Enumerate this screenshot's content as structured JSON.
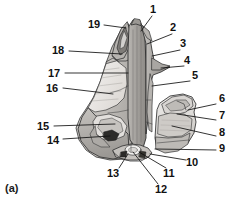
{
  "figure": {
    "caption": "(a)",
    "colors": {
      "ink": "#1a1a1a",
      "outline": "#2b2b2b",
      "fill_light": "#e7e6e4",
      "fill_mid": "#c9c7c4",
      "fill_dark": "#a8a5a2",
      "fill_deep": "#8a8784",
      "background": "#ffffff"
    }
  },
  "labels": [
    {
      "id": "1",
      "text": "1",
      "x": 150,
      "y": 4,
      "leader": [
        [
          152,
          16
        ],
        [
          141,
          31
        ]
      ]
    },
    {
      "id": "2",
      "text": "2",
      "x": 170,
      "y": 22,
      "leader": [
        [
          172,
          34
        ],
        [
          147,
          44
        ]
      ]
    },
    {
      "id": "3",
      "text": "3",
      "x": 180,
      "y": 38,
      "leader": [
        [
          180,
          50
        ],
        [
          152,
          56
        ]
      ]
    },
    {
      "id": "4",
      "text": "4",
      "x": 184,
      "y": 55,
      "leader": [
        [
          184,
          66
        ],
        [
          161,
          68
        ]
      ]
    },
    {
      "id": "5",
      "text": "5",
      "x": 192,
      "y": 70,
      "leader": [
        [
          190,
          81
        ],
        [
          152,
          86
        ]
      ]
    },
    {
      "id": "6",
      "text": "6",
      "x": 219,
      "y": 93,
      "leader": [
        [
          216,
          104
        ],
        [
          188,
          110
        ]
      ]
    },
    {
      "id": "7",
      "text": "7",
      "x": 219,
      "y": 110,
      "leader": [
        [
          216,
          120
        ],
        [
          177,
          114
        ]
      ]
    },
    {
      "id": "8",
      "text": "8",
      "x": 219,
      "y": 127,
      "leader": [
        [
          216,
          136
        ],
        [
          172,
          126
        ]
      ]
    },
    {
      "id": "9",
      "text": "9",
      "x": 219,
      "y": 143,
      "leader": [
        [
          216,
          150
        ],
        [
          155,
          149
        ]
      ]
    },
    {
      "id": "10",
      "text": "10",
      "x": 186,
      "y": 157,
      "leader": [
        [
          186,
          160
        ],
        [
          150,
          154
        ]
      ]
    },
    {
      "id": "11",
      "text": "11",
      "x": 163,
      "y": 168,
      "leader": [
        [
          166,
          168
        ],
        [
          139,
          152
        ]
      ]
    },
    {
      "id": "12",
      "text": "12",
      "x": 155,
      "y": 184,
      "leader": [
        [
          158,
          184
        ],
        [
          133,
          152
        ]
      ]
    },
    {
      "id": "13",
      "text": "13",
      "x": 107,
      "y": 168,
      "leader": [
        [
          119,
          168
        ],
        [
          128,
          154
        ]
      ]
    },
    {
      "id": "14",
      "text": "14",
      "x": 47,
      "y": 135,
      "leader": [
        [
          63,
          139
        ],
        [
          110,
          136
        ]
      ]
    },
    {
      "id": "15",
      "text": "15",
      "x": 37,
      "y": 121,
      "leader": [
        [
          54,
          126
        ],
        [
          115,
          124
        ]
      ]
    },
    {
      "id": "16",
      "text": "16",
      "x": 46,
      "y": 83,
      "leader": [
        [
          63,
          88
        ],
        [
          113,
          94
        ]
      ]
    },
    {
      "id": "17",
      "text": "17",
      "x": 48,
      "y": 68,
      "leader": [
        [
          65,
          73
        ],
        [
          128,
          73
        ]
      ]
    },
    {
      "id": "18",
      "text": "18",
      "x": 52,
      "y": 45,
      "leader": [
        [
          69,
          51
        ],
        [
          122,
          54
        ]
      ]
    },
    {
      "id": "19",
      "text": "19",
      "x": 88,
      "y": 19,
      "leader": [
        [
          104,
          25
        ],
        [
          126,
          28
        ]
      ]
    }
  ]
}
